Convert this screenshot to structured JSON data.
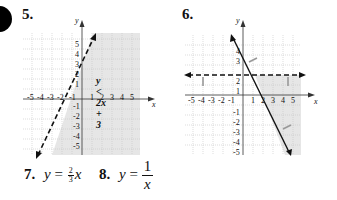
{
  "problems": [
    {
      "number": "5.",
      "label": "y < 2x + 3",
      "x_ticks": [
        "-5",
        "-4",
        "-3",
        "-2",
        "-1",
        "1",
        "2",
        "3",
        "4",
        "5"
      ],
      "y_ticks": [
        "5",
        "4",
        "3",
        "2",
        "1",
        "-1",
        "-2",
        "-3",
        "-4",
        "-5"
      ],
      "x_axis_label": "x",
      "y_axis_label": "y",
      "boundary": {
        "type": "dashed",
        "equation": "y = 2x + 3"
      },
      "shading": "below-right of line"
    },
    {
      "number": "6.",
      "x_ticks": [
        "-5",
        "-4",
        "-3",
        "-2",
        "-1",
        "1",
        "2",
        "3",
        "4",
        "5"
      ],
      "y_ticks": [
        "4",
        "3",
        "2",
        "1",
        "-1",
        "-2",
        "-3",
        "-4",
        "-5"
      ],
      "x_axis_label": "x",
      "y_axis_label": "y",
      "boundaries": [
        {
          "type": "dashed",
          "equation": "y = 2"
        },
        {
          "type": "solid",
          "equation": "y = -2x + 5"
        }
      ],
      "shading": "below y=2 and right of solid line"
    },
    {
      "number": "7.",
      "lhs": "y",
      "eq": "=",
      "frac_num": "2",
      "frac_den": "3",
      "var": "x"
    },
    {
      "number": "8.",
      "lhs": "y",
      "eq": "=",
      "frac_num": "1",
      "frac_den": "x"
    }
  ],
  "colors": {
    "shade": "#e6e6e6",
    "grid": "#c8c8c8",
    "ink": "#111111"
  }
}
